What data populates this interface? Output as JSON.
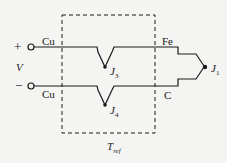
{
  "diagram": {
    "colors": {
      "wire": "#1a1a1a",
      "background": "#f4f4f2"
    },
    "terminals": {
      "plus": "+",
      "minus": "−",
      "voltage": "V"
    },
    "wires": {
      "top_left": "Cu",
      "bottom_left": "Cu",
      "top_right": "Fe",
      "bottom_right": "C"
    },
    "junctions": {
      "j1": {
        "main": "J",
        "sub": "1"
      },
      "j3": {
        "main": "J",
        "sub": "3"
      },
      "j4": {
        "main": "J",
        "sub": "4"
      }
    },
    "reference": {
      "main": "T",
      "sub": "ref"
    }
  }
}
